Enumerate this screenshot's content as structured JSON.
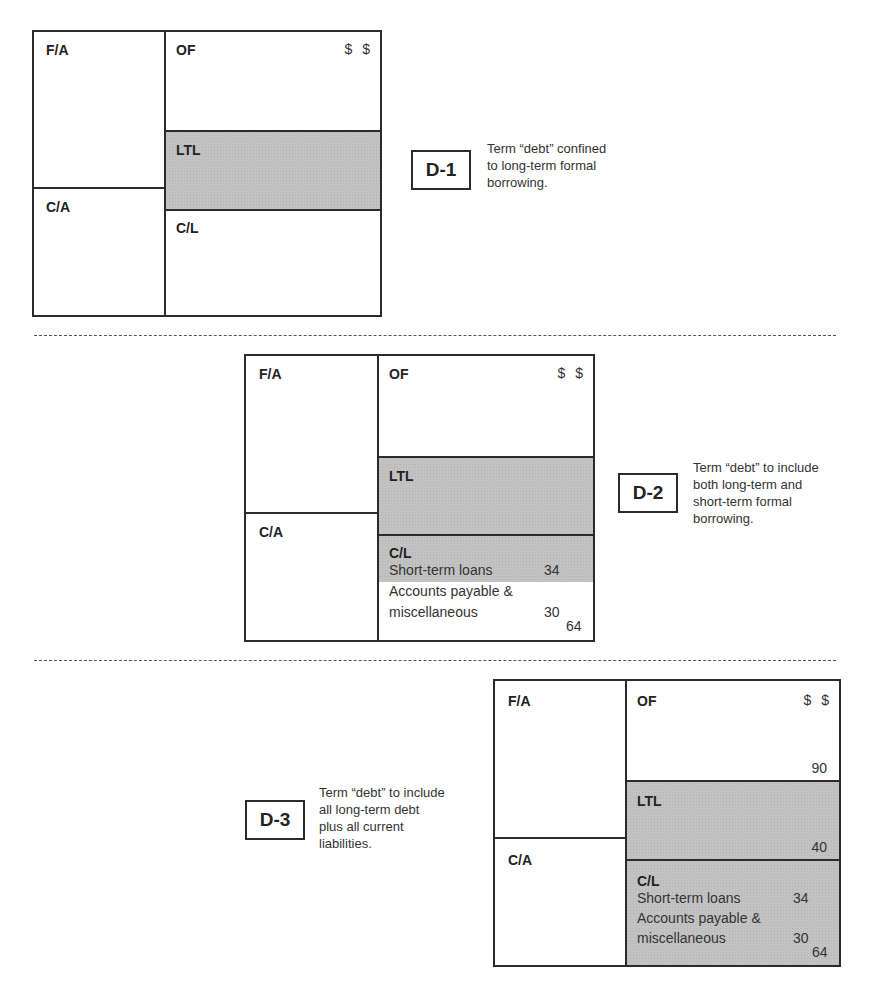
{
  "dollar_header": [
    "$",
    "$"
  ],
  "labels": {
    "fixed_assets": "F/A",
    "owners_funds": "OF",
    "long_term_liabilities": "LTL",
    "current_assets": "C/A",
    "current_liabilities": "C/L"
  },
  "panels": [
    {
      "id": "D-1",
      "tag": "D-1",
      "caption": [
        "Term “debt” confined",
        "to long-term formal",
        "borrowing."
      ],
      "shaded": [
        "LTL"
      ],
      "values": {}
    },
    {
      "id": "D-2",
      "tag": "D-2",
      "caption": [
        "Term “debt” to include",
        "both long-term and",
        "short-term formal",
        "borrowing."
      ],
      "shaded": [
        "LTL",
        "Short-term loans"
      ],
      "values": {
        "short_term_loans_label": "Short-term loans",
        "short_term_loans": "34",
        "accounts_payable_label_1": "Accounts payable &",
        "accounts_payable_label_2": "miscellaneous",
        "accounts_payable": "30",
        "cl_total": "64"
      }
    },
    {
      "id": "D-3",
      "tag": "D-3",
      "caption": [
        "Term “debt” to include",
        "all long-term debt",
        "plus all current",
        "liabilities."
      ],
      "shaded": [
        "LTL",
        "C/L"
      ],
      "values": {
        "of_total": "90",
        "ltl_total": "40",
        "short_term_loans_label": "Short-term loans",
        "short_term_loans": "34",
        "accounts_payable_label_1": "Accounts payable &",
        "accounts_payable_label_2": "miscellaneous",
        "accounts_payable": "30",
        "cl_total": "64"
      }
    }
  ],
  "colors": {
    "shade": "#c2c2c2",
    "border": "#2b2b2b",
    "text": "#2a2a2a"
  }
}
